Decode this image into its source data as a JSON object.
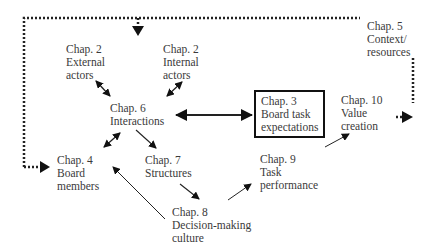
{
  "diagram": {
    "nodes": [
      {
        "id": "ch2-external",
        "lines": [
          "Chap. 2",
          "External",
          "actors"
        ]
      },
      {
        "id": "ch2-internal",
        "lines": [
          "Chap. 2",
          "Internal",
          "actors"
        ]
      },
      {
        "id": "ch5-context",
        "lines": [
          "Chap. 5",
          "Context/",
          "resources"
        ]
      },
      {
        "id": "ch6-interactions",
        "lines": [
          "Chap. 6",
          "Interactions"
        ]
      },
      {
        "id": "ch3-board-task",
        "lines": [
          "Chap. 3",
          "Board task",
          "expectations"
        ]
      },
      {
        "id": "ch10-value",
        "lines": [
          "Chap. 10",
          "Value",
          "creation"
        ]
      },
      {
        "id": "ch4-board-members",
        "lines": [
          "Chap. 4",
          "Board",
          "members"
        ]
      },
      {
        "id": "ch7-structures",
        "lines": [
          "Chap. 7",
          "Structures"
        ]
      },
      {
        "id": "ch9-task-performance",
        "lines": [
          "Chap. 9",
          "Task",
          "performance"
        ]
      },
      {
        "id": "ch8-decision-making",
        "lines": [
          "Chap. 8",
          "Decision-making",
          "culture"
        ]
      }
    ],
    "edges": [
      {
        "from": "ch2-external",
        "to": "ch6-interactions",
        "style": "solid",
        "direction": "both"
      },
      {
        "from": "ch2-internal",
        "to": "ch6-interactions",
        "style": "solid",
        "direction": "both"
      },
      {
        "from": "ch6-interactions",
        "to": "ch3-board-task",
        "style": "solid-thick",
        "direction": "both"
      },
      {
        "from": "ch6-interactions",
        "to": "ch4-board-members",
        "style": "solid",
        "direction": "both"
      },
      {
        "from": "ch6-interactions",
        "to": "ch7-structures",
        "style": "solid",
        "direction": "forward"
      },
      {
        "from": "ch7-structures",
        "to": "ch8-decision-making",
        "style": "solid",
        "direction": "forward"
      },
      {
        "from": "ch8-decision-making",
        "to": "ch4-board-members",
        "style": "solid",
        "direction": "forward"
      },
      {
        "from": "ch8-decision-making",
        "to": "ch9-task-performance",
        "style": "solid",
        "direction": "forward"
      },
      {
        "from": "ch9-task-performance",
        "to": "ch10-value",
        "style": "solid",
        "direction": "forward"
      },
      {
        "from": "ch5-context",
        "to": "ch6-interactions",
        "style": "dotted",
        "direction": "forward"
      },
      {
        "from": "ch5-context",
        "to": "ch4-board-members",
        "style": "dotted",
        "direction": "forward"
      },
      {
        "from": "ch5-context",
        "to": "ch10-value",
        "style": "dotted",
        "direction": "forward"
      }
    ]
  }
}
